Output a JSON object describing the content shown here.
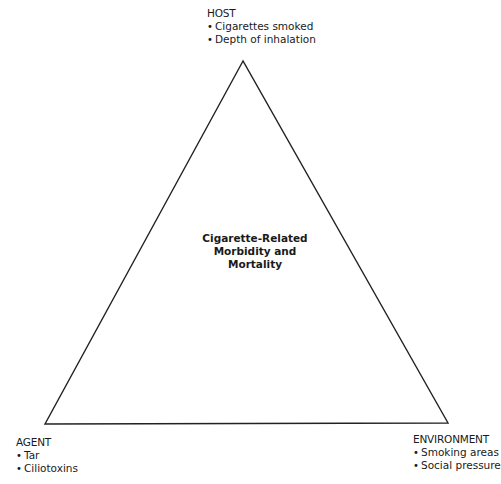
{
  "diagram": {
    "type": "epidemiologic-triangle",
    "center": {
      "lines": [
        "Cigarette-Related",
        "Morbidity and",
        "Mortality"
      ]
    },
    "vertices": {
      "host": {
        "title": "HOST",
        "items": [
          "Cigarettes smoked",
          "Depth of inhalation"
        ]
      },
      "agent": {
        "title": "AGENT",
        "items": [
          "Tar",
          "Ciliotoxins"
        ]
      },
      "environment": {
        "title": "ENVIRONMENT",
        "items": [
          "Smoking areas",
          "Social pressure"
        ]
      }
    },
    "colors": {
      "line": "#222222",
      "text": "#1a1a1a",
      "background": "#ffffff"
    }
  }
}
